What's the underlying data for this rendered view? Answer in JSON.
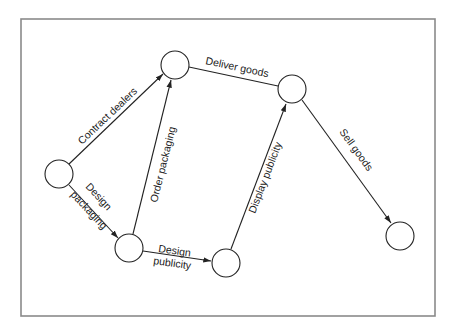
{
  "diagram": {
    "type": "activity-network",
    "nodes": [
      {
        "id": "n1",
        "cx": 59,
        "cy": 174
      },
      {
        "id": "n2",
        "cx": 175,
        "cy": 65
      },
      {
        "id": "n3",
        "cx": 129,
        "cy": 248
      },
      {
        "id": "n4",
        "cx": 226,
        "cy": 263
      },
      {
        "id": "n5",
        "cx": 292,
        "cy": 89
      },
      {
        "id": "n6",
        "cx": 400,
        "cy": 236
      }
    ],
    "edges": [
      {
        "from": "n1",
        "to": "n2",
        "label": "Contract dealers"
      },
      {
        "from": "n1",
        "to": "n3",
        "label_line1": "Design",
        "label_line2": "packaging"
      },
      {
        "from": "n3",
        "to": "n2",
        "label": "Order packaging"
      },
      {
        "from": "n3",
        "to": "n4",
        "label_line1": "Design",
        "label_line2": "publicity"
      },
      {
        "from": "n2",
        "to": "n5",
        "label": "Deliver goods"
      },
      {
        "from": "n4",
        "to": "n5",
        "label": "Display publicity"
      },
      {
        "from": "n5",
        "to": "n6",
        "label": "Sell goods"
      }
    ],
    "colors": {
      "line": "#222222",
      "frame": "#8a8a8a",
      "background": "#ffffff"
    }
  }
}
